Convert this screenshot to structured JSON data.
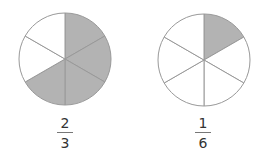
{
  "figures": [
    {
      "id": "left",
      "sectors_total": 6,
      "sectors_shaded": 4,
      "fraction": {
        "numerator": "2",
        "denominator": "3"
      },
      "center": [
        65,
        59
      ],
      "radius": 46
    },
    {
      "id": "right",
      "sectors_total": 6,
      "sectors_shaded": 1,
      "fraction": {
        "numerator": "1",
        "denominator": "6"
      },
      "center": [
        204,
        60
      ],
      "radius": 46
    }
  ],
  "colors": {
    "shade": "#b3b3b3",
    "stroke": "#999999",
    "text": "#333333"
  }
}
